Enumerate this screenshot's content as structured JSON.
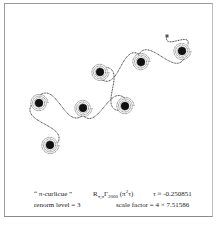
{
  "figure": {
    "title": "“ π-curlicue ”",
    "operator": {
      "main": "R",
      "sub_r": "π,π",
      "gamma": "Γ",
      "gamma_sub": "2000",
      "arg_open": "(π",
      "arg_sup": "2",
      "arg_close": "τ)"
    },
    "tau_label": "τ ≈ -0.250851",
    "renorm_label": "renorm level = 3",
    "scale_label": "scale factor = 4 × 7.51586"
  },
  "curve": {
    "color": "#333333",
    "start_point": [
      167,
      36
    ],
    "spiral_centers": [
      [
        182,
        51
      ],
      [
        141,
        62
      ],
      [
        100,
        72
      ],
      [
        125,
        106
      ],
      [
        83,
        108
      ],
      [
        39,
        103
      ],
      [
        50,
        145
      ]
    ]
  }
}
